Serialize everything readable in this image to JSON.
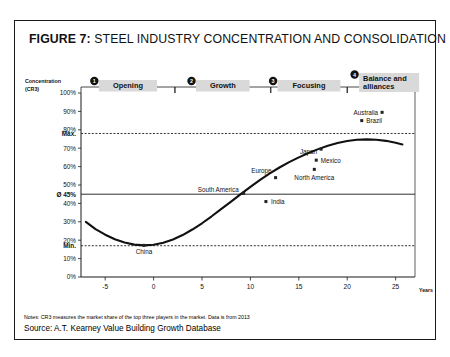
{
  "figure": {
    "label": "FIGURE 7",
    "separator": ":",
    "title": "STEEL INDUSTRY CONCENTRATION AND CONSOLIDATION",
    "notes": "Notes: CR3 measures the market share of the top three players in the market. Data is from 2013",
    "source": "Source: A.T. Kearney Value Building Growth Database"
  },
  "chart_data": {
    "type": "scatter",
    "title": "STEEL INDUSTRY CONCENTRATION AND CONSOLIDATION",
    "xlabel": "Years",
    "ylabel": "Concentration (CR3)",
    "ylabel_line1": "Concentration",
    "ylabel_line2": "(CR3)",
    "xlim": [
      -7.5,
      27
    ],
    "ylim": [
      0,
      100
    ],
    "grid": false,
    "legend": "none",
    "xticks": [
      -5,
      0,
      5,
      10,
      15,
      20,
      25
    ],
    "xticklabels": [
      "-5",
      "0",
      "5",
      "10",
      "15",
      "20",
      "25"
    ],
    "yticks": [
      0,
      10,
      20,
      30,
      40,
      50,
      60,
      70,
      80,
      90,
      100
    ],
    "yticklabels": [
      "0%",
      "10%",
      "20%",
      "30%",
      "40%",
      "50%",
      "60%",
      "70%",
      "80%",
      "90%",
      "100%"
    ],
    "reference_lines": [
      {
        "name": "max",
        "label": "Max.",
        "value": 78,
        "style": "dashed"
      },
      {
        "name": "average",
        "label": "Ø 45%",
        "value": 45,
        "style": "solid"
      },
      {
        "name": "min",
        "label": "Min.",
        "value": 17,
        "style": "dashed"
      }
    ],
    "curve": {
      "name": "S-curve of industry consolidation",
      "points": [
        {
          "x": -7.0,
          "y": 30.0
        },
        {
          "x": -6.0,
          "y": 26.0
        },
        {
          "x": -5.0,
          "y": 23.0
        },
        {
          "x": -4.0,
          "y": 20.5
        },
        {
          "x": -3.0,
          "y": 18.7
        },
        {
          "x": -2.0,
          "y": 17.6
        },
        {
          "x": -1.0,
          "y": 17.2
        },
        {
          "x": 0.0,
          "y": 17.5
        },
        {
          "x": 1.0,
          "y": 18.6
        },
        {
          "x": 2.0,
          "y": 20.4
        },
        {
          "x": 3.0,
          "y": 22.8
        },
        {
          "x": 4.0,
          "y": 25.8
        },
        {
          "x": 5.0,
          "y": 29.2
        },
        {
          "x": 6.0,
          "y": 33.0
        },
        {
          "x": 7.0,
          "y": 37.0
        },
        {
          "x": 8.0,
          "y": 41.0
        },
        {
          "x": 9.0,
          "y": 45.0
        },
        {
          "x": 10.0,
          "y": 49.0
        },
        {
          "x": 11.0,
          "y": 52.8
        },
        {
          "x": 12.0,
          "y": 56.3
        },
        {
          "x": 13.0,
          "y": 59.5
        },
        {
          "x": 14.0,
          "y": 62.4
        },
        {
          "x": 15.0,
          "y": 65.0
        },
        {
          "x": 16.0,
          "y": 67.4
        },
        {
          "x": 17.0,
          "y": 69.5
        },
        {
          "x": 18.0,
          "y": 71.3
        },
        {
          "x": 19.0,
          "y": 72.8
        },
        {
          "x": 20.0,
          "y": 73.9
        },
        {
          "x": 21.0,
          "y": 74.6
        },
        {
          "x": 22.0,
          "y": 74.8
        },
        {
          "x": 23.0,
          "y": 74.6
        },
        {
          "x": 24.0,
          "y": 74.0
        },
        {
          "x": 25.0,
          "y": 73.0
        },
        {
          "x": 25.7,
          "y": 72.0
        }
      ]
    },
    "points": [
      {
        "label": "China",
        "x": -1.0,
        "y": 17.2,
        "label_dx": 0,
        "label_dy": 9,
        "anchor": "middle"
      },
      {
        "label": "South America",
        "x": 9.3,
        "y": 45.5,
        "label_dx": -5,
        "label_dy": -1,
        "anchor": "end"
      },
      {
        "label": "India",
        "x": 11.6,
        "y": 41.0,
        "label_dx": 5,
        "label_dy": 2.4,
        "anchor": "start"
      },
      {
        "label": "Europe",
        "x": 12.6,
        "y": 54.0,
        "label_dx": -4,
        "label_dy": -5,
        "anchor": "end"
      },
      {
        "label": "North America",
        "x": 16.6,
        "y": 58.5,
        "label_dx": 0,
        "label_dy": 11,
        "anchor": "middle"
      },
      {
        "label": "Mexico",
        "x": 16.8,
        "y": 63.5,
        "label_dx": 4.5,
        "label_dy": 2.4,
        "anchor": "start"
      },
      {
        "label": "Japan",
        "x": 17.3,
        "y": 69.5,
        "label_dx": -4,
        "label_dy": 4.5,
        "anchor": "end"
      },
      {
        "label": "Brazil",
        "x": 21.5,
        "y": 85.0,
        "label_dx": 4.5,
        "label_dy": 2.4,
        "anchor": "start"
      },
      {
        "label": "Australia",
        "x": 23.6,
        "y": 89.5,
        "label_dx": -4,
        "label_dy": 2.4,
        "anchor": "end"
      }
    ],
    "phases": [
      {
        "number": "1",
        "label": "Opening",
        "label_line2": "",
        "x_start": -7.5,
        "x_end": 2.2
      },
      {
        "number": "2",
        "label": "Growth",
        "label_line2": "",
        "x_start": 2.2,
        "x_end": 12.1
      },
      {
        "number": "3",
        "label": "Focusing",
        "label_line2": "",
        "x_start": 12.1,
        "x_end": 20.0
      },
      {
        "number": "4",
        "label": "Balance and",
        "label_line2": "alliances",
        "x_start": 20.0,
        "x_end": 27.0
      }
    ],
    "colors": {
      "axis": "#1a1a1a",
      "curve": "#111111",
      "point": "#222222",
      "banner": "#d9d9d9",
      "frame": "#1a1a1a",
      "background": "#ffffff"
    }
  }
}
